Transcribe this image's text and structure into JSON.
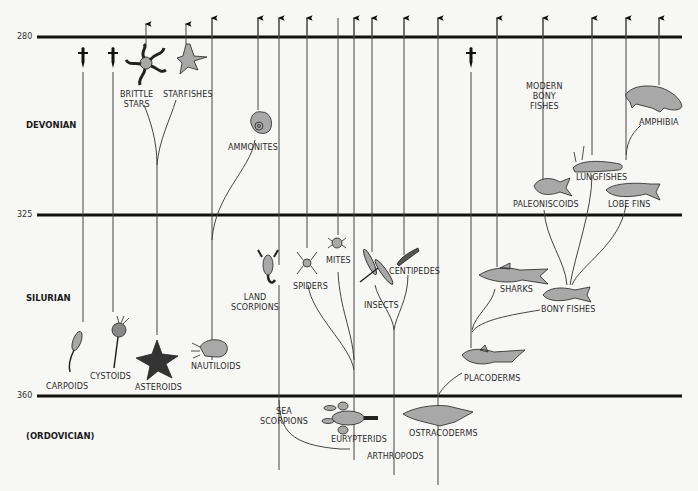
{
  "diagram": {
    "type": "evolutionary-timeline",
    "periods": [
      {
        "name": "DEVONIAN",
        "top": 280,
        "bottom": 325
      },
      {
        "name": "SILURIAN",
        "top": 325,
        "bottom": 360
      },
      {
        "name": "(ORDOVICIAN)",
        "top": 360
      }
    ],
    "time_ticks": [
      "280",
      "325",
      "360"
    ],
    "colors": {
      "background": "#f7f7f5",
      "line": "#111111",
      "fill": "#a8a8a8",
      "text": "#2a2a2a"
    },
    "groups": {
      "echinoderms": {
        "brittle_stars": "BRITTLE",
        "brittle_stars_2": "STARS",
        "starfishes": "STARFISHES",
        "carpoids": "CARPOIDS",
        "cystoids": "CYSTOIDS",
        "asteroids": "ASTEROIDS"
      },
      "cephalopods": {
        "ammonites": "AMMONITES",
        "nautiloids": "NAUTILOIDS"
      },
      "arthropods": {
        "land_scorpions": "LAND",
        "land_scorpions_2": "SCORPIONS",
        "spiders": "SPIDERS",
        "mites": "MITES",
        "insects": "INSECTS",
        "centipedes": "CENTIPEDES",
        "sea_scorpions": "SEA",
        "sea_scorpions_2": "SCORPIONS",
        "eurypterids": "EURYPTERIDS",
        "arthropods": "ARTHROPODS"
      },
      "vertebrates": {
        "modern_bony_fishes": "MODERN",
        "modern_bony_fishes_2": "BONY",
        "modern_bony_fishes_3": "FISHES",
        "amphibia": "AMPHIBIA",
        "lungfishes": "LUNGFISHES",
        "paleoniscoids": "PALEONISCOIDS",
        "lobe_fins": "LOBE  FINS",
        "sharks": "SHARKS",
        "bony_fishes": "BONY  FISHES",
        "placoderms": "PLACODERMS",
        "ostracoderms": "OSTRACODERMS"
      }
    },
    "extinction_marker": "†"
  }
}
